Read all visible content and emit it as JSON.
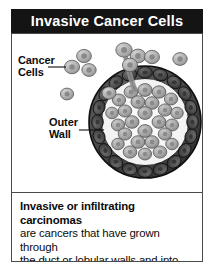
{
  "figure": {
    "title": "Invasive Cancer Cells",
    "labels": {
      "cancer_cells_line1": "Cancer",
      "cancer_cells_line2": "Cells",
      "outer_wall_line1": "Outer",
      "outer_wall_line2": "Wall"
    },
    "caption": {
      "lead": "Invasive or infiltrating carcinomas",
      "line2": "are cancers that have grown through",
      "line3": "the duct or lobular walls and into",
      "line4": "surrounding connective tissues."
    },
    "colors": {
      "title_bar_bg": "#141414",
      "title_text": "#ffffff",
      "panel_border": "#4a4a4a",
      "panel_bg": "#ffffff",
      "outer_wall_cell": "#4e4e4e",
      "outer_wall_outline": "#111111",
      "inner_cell": "#a9a9a9",
      "inner_cell_outline": "#4a4a4a",
      "nucleus": "#6e6e6e",
      "free_cell": "#b4b4b4",
      "leader_line": "#111111",
      "label_text": "#0d0d0d",
      "caption_text": "#0b0b0b"
    }
  }
}
